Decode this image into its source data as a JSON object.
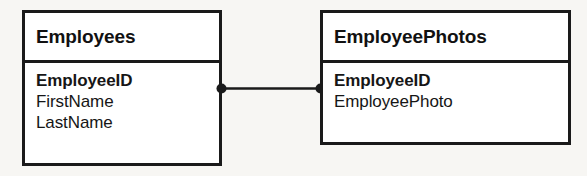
{
  "diagram": {
    "type": "entity-relationship",
    "background_color": "#f7f6f3",
    "line_color": "#1a1a1a",
    "box_fill_color": "#ffffff",
    "entities": [
      {
        "name": "Employees",
        "fields": [
          {
            "name": "EmployeeID",
            "key": true
          },
          {
            "name": "FirstName",
            "key": false
          },
          {
            "name": "LastName",
            "key": false
          }
        ]
      },
      {
        "name": "EmployeePhotos",
        "fields": [
          {
            "name": "EmployeeID",
            "key": true
          },
          {
            "name": "EmployeePhoto",
            "key": false
          }
        ]
      }
    ],
    "relationship": {
      "from": "Employees.EmployeeID",
      "to": "EmployeePhotos.EmployeeID",
      "from_endpoint": "filled-circle",
      "to_endpoint": "filled-circle",
      "cardinality": "one-to-one",
      "line_style": "solid"
    }
  }
}
